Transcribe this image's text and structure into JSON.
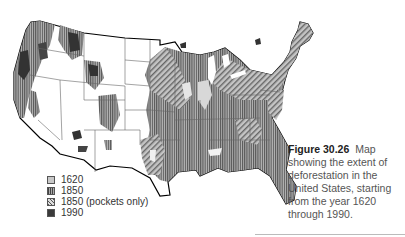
{
  "figure": {
    "number": "Figure 30.26",
    "caption": "Map showing the extent of deforestation in the United States, starting from the year 1620 through 1990."
  },
  "map": {
    "subject": "Contiguous United States forest cover",
    "legend": [
      {
        "label": "1620",
        "pattern": "light-gray-solid",
        "color": "#c8c8c8"
      },
      {
        "label": "1850",
        "pattern": "vertical-stripes",
        "color": "#6a6a6a"
      },
      {
        "label": "1850 (pockets only)",
        "pattern": "diagonal-stripes",
        "color": "#9a9a9a"
      },
      {
        "label": "1990",
        "pattern": "dark-solid",
        "color": "#3a3a3a"
      }
    ]
  },
  "colors": {
    "background": "#ffffff",
    "state_border": "#666666",
    "coast_outline": "#000000",
    "caption_text": "#555555",
    "caption_bold": "#222222"
  }
}
